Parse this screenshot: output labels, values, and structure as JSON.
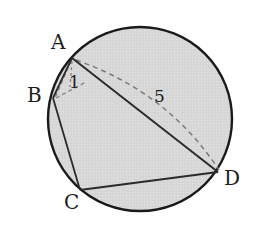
{
  "figure": {
    "kind": "circle-with-inscribed-quadrilateral",
    "canvas": {
      "width": 261,
      "height": 227,
      "background": "#ffffff"
    },
    "circle": {
      "name": "circumscribed-circle",
      "cx": 140,
      "cy": 119,
      "r": 92,
      "fill": "#d7d7d7",
      "stroke": "#1a1a1a",
      "stroke_width": 2.4
    },
    "colors": {
      "outline": "#1a1a1a",
      "chord": "#2b2b2b",
      "dashed": "#6e6e6e",
      "fill": "#d7d7d7",
      "text": "#1c1c1c"
    },
    "vertices": [
      {
        "id": "A",
        "label": "A",
        "x": 72,
        "y": 58,
        "label_x": 51,
        "label_y": 32
      },
      {
        "id": "B",
        "label": "B",
        "x": 53,
        "y": 98,
        "label_x": 27,
        "label_y": 85
      },
      {
        "id": "C",
        "label": "C",
        "x": 80,
        "y": 190,
        "label_x": 64,
        "label_y": 192
      },
      {
        "id": "D",
        "label": "D",
        "x": 218,
        "y": 172,
        "label_x": 224,
        "label_y": 168
      }
    ],
    "solid_segments": [
      {
        "name": "segment-AD",
        "from": "A",
        "to": "D",
        "x1": 72,
        "y1": 58,
        "x2": 218,
        "y2": 172
      },
      {
        "name": "segment-BC",
        "from": "B",
        "to": "C",
        "x1": 53,
        "y1": 98,
        "x2": 80,
        "y2": 190
      },
      {
        "name": "segment-CD",
        "from": "C",
        "to": "D",
        "x1": 80,
        "y1": 190,
        "x2": 218,
        "y2": 172
      },
      {
        "name": "segment-AB",
        "from": "A",
        "to": "B",
        "x1": 72,
        "y1": 58,
        "x2": 53,
        "y2": 98
      }
    ],
    "dashed_segments": [
      {
        "name": "dashed-chord-AB",
        "from": "A",
        "to": "B",
        "x1": 72,
        "y1": 58,
        "x2": 53,
        "y2": 98,
        "measure": "1",
        "dasharray": "4 3"
      },
      {
        "name": "dashed-tick-A",
        "from": "A",
        "to": "interior",
        "x1": 72,
        "y1": 60,
        "x2": 70,
        "y2": 86,
        "dasharray": "3 3"
      },
      {
        "name": "dashed-arc-AD",
        "from": "A",
        "to": "D",
        "x1": 76,
        "y1": 60,
        "cx": 168,
        "cy": 92,
        "x2": 219,
        "y2": 170,
        "measure": "5",
        "dasharray": "5 4"
      }
    ],
    "measures": [
      {
        "id": "one",
        "value": "1",
        "applies_to": "dashed-chord-AB",
        "x": 69,
        "y": 74
      },
      {
        "id": "five",
        "value": "5",
        "applies_to": "dashed-arc-AD",
        "x": 154,
        "y": 88
      }
    ]
  }
}
